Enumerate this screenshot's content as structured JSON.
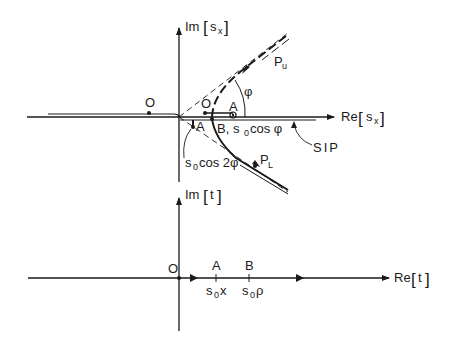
{
  "upper_plane": {
    "im_axis": {
      "prefix": "Im",
      "var": "s",
      "sub": "x"
    },
    "re_axis": {
      "prefix": "Re",
      "var": "s",
      "sub": "x"
    },
    "labels": {
      "origin_left": "O",
      "origin_right": "O",
      "point_a_upper": "A",
      "point_a_lower": "A",
      "point_b": "B, s",
      "point_b_sub": "0",
      "point_b_tail": "cos φ",
      "cos2phi_s": "s",
      "cos2phi_sub": "0",
      "cos2phi_tail": "cos 2φ",
      "phi": "φ",
      "pu": "P",
      "pu_sub": "u",
      "pl": "P",
      "pl_sub": "L",
      "sip": "SIP"
    }
  },
  "lower_plane": {
    "im_axis": {
      "prefix": "Im",
      "var": "t"
    },
    "re_axis": {
      "prefix": "Re",
      "var": "t"
    },
    "labels": {
      "origin": "O",
      "point_a": "A",
      "point_b": "B",
      "a_value_s": "s",
      "a_value_sub": "0",
      "a_value_tail": "x",
      "b_value_s": "s",
      "b_value_sub": "0",
      "b_value_tail": "ρ"
    }
  }
}
